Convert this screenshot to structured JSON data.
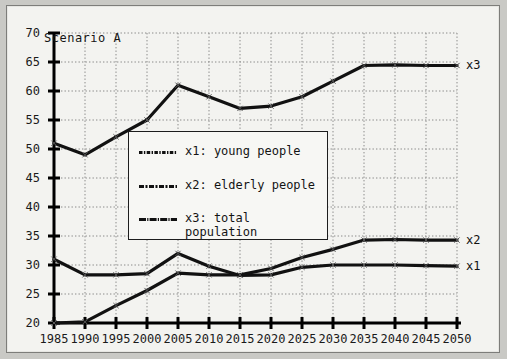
{
  "annotations": {
    "scenario_label": "Scenario A",
    "end_labels": [
      {
        "name": "x3",
        "text": "x3",
        "value": 64.5
      },
      {
        "name": "x2",
        "text": "x2",
        "value": 34.3
      },
      {
        "name": "x1",
        "text": "x1",
        "value": 29.8
      }
    ]
  },
  "legend": {
    "position": "center",
    "entries": [
      {
        "key": "x1",
        "label": "x1: young people",
        "line2": ""
      },
      {
        "key": "x2",
        "label": "x2: elderly people",
        "line2": ""
      },
      {
        "key": "x3",
        "label": "x3: total",
        "line2": "population"
      }
    ]
  },
  "colors": {
    "line": "#111111",
    "grid": "#8a8a88",
    "axis": "#000000",
    "panel_bg": "#f3f3f0",
    "outer_bg": "#c9c9c5",
    "legend_bg": "#f7f7f4"
  },
  "chart_data": {
    "type": "line",
    "title": "Scenario A",
    "xlabel": "",
    "ylabel": "",
    "xlim": [
      1985,
      2050
    ],
    "ylim": [
      20,
      70
    ],
    "ytick_step": 5,
    "xtick_step": 5,
    "grid": true,
    "x": [
      1985,
      1990,
      1995,
      2000,
      2005,
      2010,
      2015,
      2020,
      2025,
      2030,
      2035,
      2040,
      2045,
      2050
    ],
    "xticklabels": [
      "1985",
      "1990",
      "1995",
      "2000",
      "2005",
      "2010",
      "2015",
      "2020",
      "2025",
      "2030",
      "2035",
      "2040",
      "2045",
      "2050"
    ],
    "yticklabels": [
      "20",
      "25",
      "30",
      "35",
      "40",
      "45",
      "50",
      "55",
      "60",
      "65",
      "70"
    ],
    "series": [
      {
        "name": "x1: young people",
        "key": "x1",
        "values": [
          31.0,
          28.3,
          28.3,
          28.5,
          32.0,
          29.8,
          28.2,
          28.3,
          29.6,
          30.0,
          30.0,
          30.0,
          29.9,
          29.8
        ]
      },
      {
        "name": "x2: elderly people",
        "key": "x2",
        "values": [
          20.0,
          20.2,
          23.0,
          25.6,
          28.6,
          28.3,
          28.3,
          29.4,
          31.3,
          32.7,
          34.3,
          34.4,
          34.3,
          34.3
        ]
      },
      {
        "name": "x3: total population",
        "key": "x3",
        "values": [
          51.0,
          49.0,
          52.1,
          55.0,
          61.0,
          59.0,
          57.0,
          57.4,
          59.0,
          61.7,
          64.4,
          64.5,
          64.4,
          64.4
        ]
      }
    ]
  }
}
